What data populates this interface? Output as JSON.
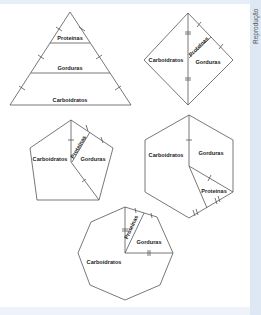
{
  "credit": "Reprodução",
  "labels": {
    "proteins": "Proteínas",
    "fats": "Gorduras",
    "carbs": "Carboidratos"
  },
  "figures": [
    {
      "shape": "triangle",
      "sections": [
        "Proteínas",
        "Gorduras",
        "Carboidratos"
      ]
    },
    {
      "shape": "square (rotated)",
      "sections": [
        "Carboidratos",
        "Proteínas",
        "Gorduras"
      ]
    },
    {
      "shape": "pentagon",
      "sections": [
        "Carboidratos",
        "Proteínas",
        "Gorduras"
      ]
    },
    {
      "shape": "hexagon",
      "sections": [
        "Carboidratos",
        "Gorduras",
        "Proteínas"
      ]
    },
    {
      "shape": "octagon",
      "sections": [
        "Proteínas",
        "Gorduras",
        "Carboidratos"
      ]
    }
  ],
  "colors": {
    "line": "#555555",
    "side_strip": "#dde8f4",
    "top_band": "#e6eef7"
  }
}
